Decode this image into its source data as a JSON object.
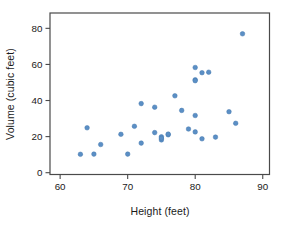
{
  "chart_data": {
    "type": "scatter",
    "title": "",
    "xlabel": "Height (feet)",
    "ylabel": "Volume (cubic feet)",
    "xlim": [
      58.5,
      91
    ],
    "ylim": [
      -1,
      88.5
    ],
    "x_ticks": [
      60,
      70,
      80,
      90
    ],
    "y_ticks": [
      0,
      20,
      40,
      60,
      80
    ],
    "grid": false,
    "legend": "none",
    "point_color": "#5b8fc5",
    "point_edge_color": "#4579ae",
    "axis_color": "#4a4a4a",
    "text_color": "#1a1a1a",
    "background_color": "#ffffff",
    "points": [
      {
        "x": 70,
        "y": 10.3
      },
      {
        "x": 65,
        "y": 10.3
      },
      {
        "x": 63,
        "y": 10.2
      },
      {
        "x": 72,
        "y": 16.4
      },
      {
        "x": 81,
        "y": 18.8
      },
      {
        "x": 83,
        "y": 19.7
      },
      {
        "x": 66,
        "y": 15.6
      },
      {
        "x": 75,
        "y": 18.2
      },
      {
        "x": 80,
        "y": 22.6
      },
      {
        "x": 75,
        "y": 19.9
      },
      {
        "x": 79,
        "y": 24.2
      },
      {
        "x": 76,
        "y": 21.0
      },
      {
        "x": 76,
        "y": 21.4
      },
      {
        "x": 69,
        "y": 21.3
      },
      {
        "x": 75,
        "y": 19.1
      },
      {
        "x": 74,
        "y": 22.2
      },
      {
        "x": 85,
        "y": 33.8
      },
      {
        "x": 86,
        "y": 27.4
      },
      {
        "x": 71,
        "y": 25.7
      },
      {
        "x": 64,
        "y": 24.9
      },
      {
        "x": 78,
        "y": 34.5
      },
      {
        "x": 80,
        "y": 31.7
      },
      {
        "x": 74,
        "y": 36.3
      },
      {
        "x": 72,
        "y": 38.3
      },
      {
        "x": 77,
        "y": 42.6
      },
      {
        "x": 81,
        "y": 55.4
      },
      {
        "x": 82,
        "y": 55.7
      },
      {
        "x": 80,
        "y": 58.3
      },
      {
        "x": 80,
        "y": 51.5
      },
      {
        "x": 80,
        "y": 51.0
      },
      {
        "x": 87,
        "y": 77.0
      }
    ]
  }
}
